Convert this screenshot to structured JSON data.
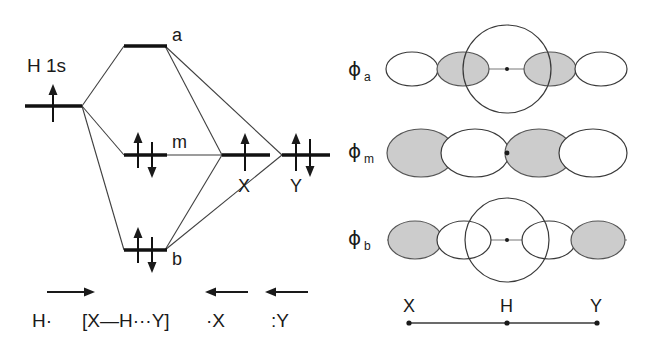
{
  "mo_diagram": {
    "fragment_label": "H 1s",
    "levels": [
      {
        "key": "a",
        "label": "a",
        "electrons": "empty",
        "role": "antibonding"
      },
      {
        "key": "m",
        "label": "m",
        "electrons": "pair",
        "role": "nonbonding"
      },
      {
        "key": "b",
        "label": "b",
        "electrons": "pair",
        "role": "bonding"
      }
    ],
    "right_levels": [
      {
        "key": "X",
        "label": "X",
        "electrons": "single"
      },
      {
        "key": "Y",
        "label": "Y",
        "electrons": "pair"
      }
    ],
    "left_level": {
      "key": "H1s",
      "label": "H 1s",
      "electrons": "single"
    }
  },
  "reaction": {
    "reactant": "H·",
    "transition_state": "[X—H···Y]",
    "partner_x": "·X",
    "partner_y": ":Y",
    "arrow_forward": "right-arrow",
    "arrow_back_x": "left-arrow",
    "arrow_back_y": "left-arrow"
  },
  "orbitals": {
    "rows": [
      {
        "key": "phi_a",
        "symbol": "ϕ",
        "subscript": "a",
        "has_center_s": true,
        "center_s_shaded": false,
        "lobes": [
          "white",
          "shaded",
          "shaded",
          "white"
        ]
      },
      {
        "key": "phi_m",
        "symbol": "ϕ",
        "subscript": "m",
        "has_center_s": false,
        "center_s_shaded": false,
        "lobes": [
          "shaded",
          "white",
          "shaded",
          "white"
        ]
      },
      {
        "key": "phi_b",
        "symbol": "ϕ",
        "subscript": "b",
        "has_center_s": true,
        "center_s_shaded": false,
        "lobes": [
          "shaded",
          "white",
          "white",
          "shaded"
        ]
      }
    ],
    "axis": {
      "left_atom": "X",
      "center_atom": "H",
      "right_atom": "Y"
    }
  },
  "colors": {
    "ink": "#1a1a1a",
    "line": "#3a3a3a",
    "shade": "#cccccc",
    "background": "#ffffff"
  }
}
